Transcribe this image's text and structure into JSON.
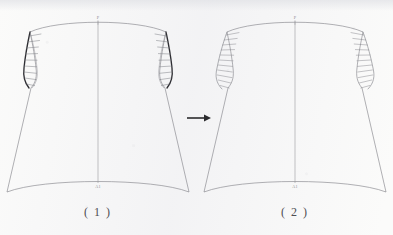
{
  "document": {
    "kind": "garment-pattern-draft",
    "background_color": "#fbfbfa",
    "ink_color": "#6f7076",
    "bold_ink_color": "#2f2f34"
  },
  "transition": {
    "arrow_glyph": "→",
    "direction": "right",
    "color": "#2b2b2e"
  },
  "figures": [
    {
      "id": "figure-1",
      "caption": "( 1 )",
      "top_point_label": "P",
      "bottom_point_label": "A1",
      "armhole_style": "bold",
      "armhole_color": "#2f2f34",
      "tick_count": 9,
      "tick_length": "short"
    },
    {
      "id": "figure-2",
      "caption": "( 2 )",
      "top_point_label": "P",
      "bottom_point_label": "A1",
      "armhole_style": "light",
      "armhole_color": "#8d8e94",
      "tick_count": 11,
      "tick_length": "long"
    }
  ]
}
